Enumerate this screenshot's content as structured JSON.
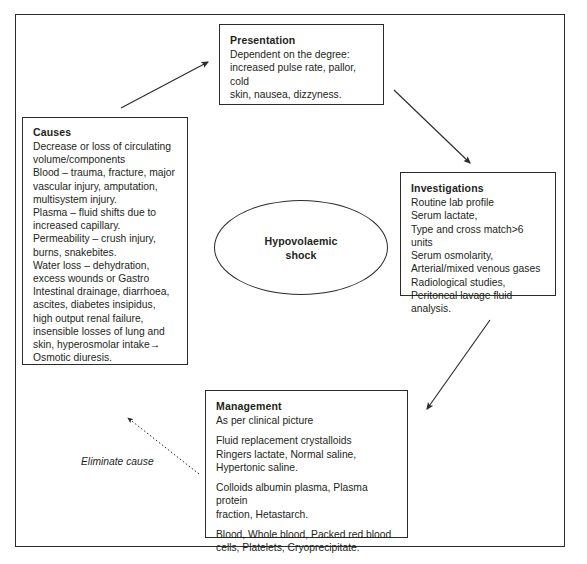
{
  "diagram": {
    "title": "Hypovolaemic shock",
    "center_node": {
      "label_line1": "Hypovolaemic",
      "label_line2": "shock"
    },
    "edge_label": "Eliminate cause",
    "stroke_color": "#2b2b2b",
    "text_color": "#231f20",
    "background": "#ffffff"
  },
  "boxes": {
    "presentation": {
      "title": "Presentation",
      "lines": [
        "Dependent on the degree:",
        "increased pulse rate, pallor, cold",
        "skin, nausea, dizzyness."
      ]
    },
    "causes": {
      "title": "Causes",
      "lines": [
        {
          "text": "Decrease or loss of circulating",
          "style": "normal"
        },
        {
          "text": "volume/components",
          "style": "normal"
        },
        {
          "text": "Blood",
          "style": "italic-lead",
          "rest": " – trauma, fracture, major"
        },
        {
          "text": "vascular injury, amputation,",
          "style": "normal"
        },
        {
          "text": "multisystem injury.",
          "style": "normal"
        },
        {
          "text": "Plasma",
          "style": "italic-lead",
          "rest": " – fluid shifts due to"
        },
        {
          "text": "increased capillary.",
          "style": "normal"
        },
        {
          "text": "Permeability",
          "style": "italic-lead",
          "rest": " – crush injury,"
        },
        {
          "text": "burns, snakebites.",
          "style": "normal"
        },
        {
          "text": "Water loss",
          "style": "italic-lead",
          "rest": " – dehydration,"
        },
        {
          "text": "excess wounds or Gastro",
          "style": "normal"
        },
        {
          "text": "Intestinal drainage, diarrhoea,",
          "style": "normal"
        },
        {
          "text": "ascites, diabetes insipidus,",
          "style": "normal"
        },
        {
          "text": "high output renal failure,",
          "style": "normal"
        },
        {
          "text": "insensible losses of lung and",
          "style": "normal"
        },
        {
          "text": "skin, hyperosmolar intake→",
          "style": "normal"
        },
        {
          "text": "Osmotic diuresis.",
          "style": "normal"
        }
      ]
    },
    "investigations": {
      "title": "Investigations",
      "lines": [
        "Routine lab profile",
        "Serum lactate,",
        "Type and cross match>6 units",
        "Serum osmolarity,",
        "Arterial/mixed venous gases",
        "Radiological studies,",
        "Peritoneal lavage fluid analysis."
      ]
    },
    "management": {
      "title": "Management",
      "groups": [
        [
          "As per clinical picture"
        ],
        [
          "Fluid replacement crystalloids",
          "Ringers lactate, Normal saline,",
          "Hypertonic saline."
        ],
        [
          "Colloids albumin plasma, Plasma protein",
          "fraction, Hetastarch."
        ],
        [
          "Blood, Whole blood, Packed red blood",
          "cells, Platelets, Cryoprecipitate."
        ]
      ]
    }
  },
  "arrows": [
    {
      "name": "causes-to-presentation",
      "style": "solid"
    },
    {
      "name": "presentation-to-investigations",
      "style": "solid"
    },
    {
      "name": "investigations-to-management",
      "style": "solid"
    },
    {
      "name": "management-to-causes",
      "style": "dotted",
      "label": "Eliminate cause"
    }
  ]
}
